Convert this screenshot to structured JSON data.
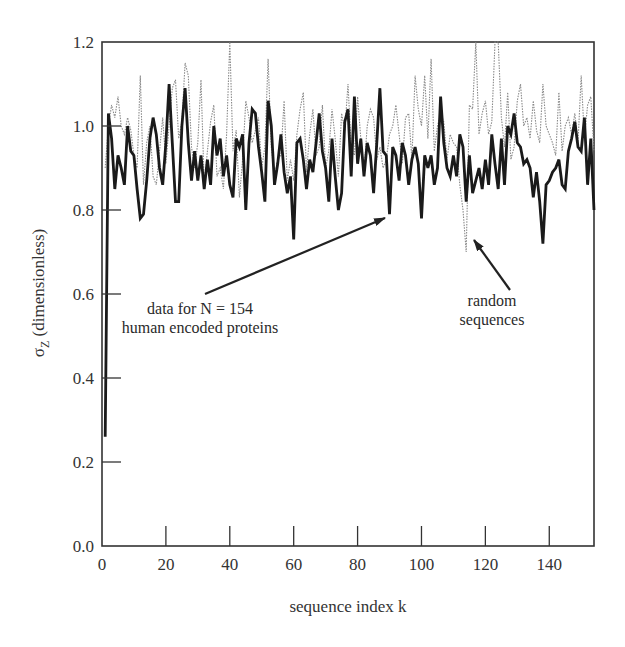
{
  "chart_data": {
    "type": "line",
    "title": "",
    "xlabel": "sequence index k",
    "ylabel": "σZ (dimensionless)",
    "ylabel_symbol": "σ",
    "ylabel_subscript": "Z",
    "ylabel_rest": " (dimensionless)",
    "xlim": [
      0,
      154
    ],
    "ylim": [
      0.0,
      1.2
    ],
    "xticks": [
      0,
      20,
      40,
      60,
      80,
      100,
      120,
      140
    ],
    "xtick_labels": [
      "0",
      "20",
      "40",
      "60",
      "80",
      "100",
      "120",
      "140"
    ],
    "yticks": [
      0.0,
      0.2,
      0.4,
      0.6,
      0.8,
      1.0,
      1.2
    ],
    "ytick_labels": [
      "0.0",
      "0.2",
      "0.4",
      "0.6",
      "0.8",
      "1.0",
      "1.2"
    ],
    "grid": false,
    "legend": null,
    "series": [
      {
        "name": "data for N = 154 human encoded proteins",
        "style": "solid-thick",
        "color": "#1a1a1a",
        "x_start": 1,
        "values": [
          0.26,
          1.03,
          0.97,
          0.85,
          0.93,
          0.9,
          0.86,
          1.0,
          0.94,
          0.93,
          0.85,
          0.78,
          0.79,
          0.87,
          0.97,
          1.02,
          0.98,
          0.9,
          0.86,
          0.96,
          1.1,
          0.96,
          0.82,
          0.82,
          1.0,
          1.09,
          0.96,
          0.87,
          0.94,
          0.87,
          0.93,
          0.85,
          0.92,
          0.86,
          1.0,
          0.93,
          0.97,
          0.88,
          0.93,
          0.86,
          0.83,
          0.97,
          0.95,
          0.98,
          0.8,
          0.96,
          1.04,
          1.03,
          0.95,
          0.89,
          0.82,
          1.06,
          1.0,
          0.86,
          0.91,
          0.98,
          0.89,
          0.84,
          0.88,
          0.73,
          0.96,
          0.97,
          0.92,
          0.85,
          0.92,
          0.89,
          0.96,
          1.03,
          0.94,
          0.9,
          0.82,
          0.97,
          0.88,
          0.8,
          0.84,
          1.01,
          1.04,
          0.88,
          1.07,
          0.91,
          0.97,
          0.88,
          0.96,
          0.93,
          0.84,
          0.96,
          1.09,
          0.94,
          0.93,
          0.79,
          0.95,
          0.93,
          0.87,
          0.96,
          0.93,
          0.86,
          0.92,
          0.95,
          0.91,
          0.78,
          0.93,
          0.9,
          0.93,
          0.86,
          0.9,
          1.07,
          0.96,
          0.9,
          0.88,
          0.93,
          0.88,
          0.98,
          0.95,
          0.82,
          0.93,
          0.84,
          0.87,
          0.9,
          0.85,
          0.92,
          0.86,
          0.98,
          0.91,
          0.85,
          0.97,
          0.86,
          1.0,
          0.98,
          1.03,
          0.96,
          0.95,
          0.91,
          0.92,
          0.9,
          0.83,
          0.89,
          0.82,
          0.72,
          0.86,
          0.87,
          0.89,
          0.9,
          0.92,
          0.86,
          0.85,
          0.94,
          0.97,
          1.01,
          0.95,
          0.94,
          1.02,
          0.86,
          0.97,
          0.8
        ]
      },
      {
        "name": "random sequences",
        "style": "dotted-thin",
        "color": "#8a8a8a",
        "x_start": 1,
        "values": [
          0.9,
          1.0,
          1.05,
          1.02,
          1.07,
          1.0,
          0.98,
          1.02,
          0.99,
          0.93,
          0.9,
          1.12,
          0.86,
          0.96,
          1.0,
          0.88,
          0.86,
          0.94,
          1.02,
          0.91,
          1.0,
          1.09,
          1.11,
          0.97,
          1.01,
          1.15,
          1.12,
          0.95,
          0.9,
          0.96,
          1.11,
          0.86,
          0.94,
          1.01,
          1.05,
          0.88,
          0.9,
          0.85,
          0.98,
          1.2,
          0.94,
          0.99,
          0.83,
          0.92,
          1.06,
          1.02,
          0.96,
          0.99,
          1.02,
          0.9,
          0.95,
          1.16,
          0.95,
          0.88,
          0.92,
          0.93,
          1.06,
          0.87,
          0.92,
          0.87,
          0.98,
          1.04,
          1.08,
          0.89,
          0.98,
          1.04,
          0.93,
          0.95,
          1.05,
          0.9,
          0.94,
          1.04,
          0.97,
          0.88,
          1.03,
          0.99,
          1.1,
          0.95,
          0.93,
          1.07,
          0.97,
          0.89,
          1.0,
          1.04,
          1.02,
          0.92,
          0.95,
          0.9,
          0.92,
          0.98,
          1.0,
          1.05,
          0.98,
          0.91,
          1.02,
          1.03,
          0.92,
          1.12,
          1.04,
          1.0,
          1.12,
          0.97,
          1.16,
          0.94,
          1.0,
          1.03,
          1.01,
          0.92,
          0.98,
          0.96,
          0.95,
          0.86,
          0.8,
          0.7,
          1.05,
          1.04,
          1.2,
          0.98,
          1.03,
          1.06,
          0.98,
          1.01,
          1.2,
          1.2,
          1.02,
          0.95,
          1.08,
          0.92,
          0.95,
          1.06,
          1.1,
          1.0,
          1.02,
          0.97,
          1.06,
          0.99,
          0.96,
          1.1,
          1.0,
          0.98,
          0.96,
          0.93,
          1.08,
          0.94,
          1.0,
          1.02,
          0.98,
          1.03,
          0.96,
          1.12,
          0.97,
          1.05,
          1.07,
          0.94
        ]
      }
    ],
    "annotations": [
      {
        "id": "proteins",
        "lines": [
          "data for N = 154",
          "human encoded proteins"
        ],
        "text_pos_px": [
          200,
          314
        ],
        "arrow_from_px": [
          205,
          294
        ],
        "arrow_to_px": [
          385,
          218
        ]
      },
      {
        "id": "random",
        "lines": [
          "random",
          "sequences"
        ],
        "text_pos_px": [
          492,
          306
        ],
        "arrow_from_px": [
          510,
          290
        ],
        "arrow_to_px": [
          474,
          240
        ]
      }
    ]
  }
}
